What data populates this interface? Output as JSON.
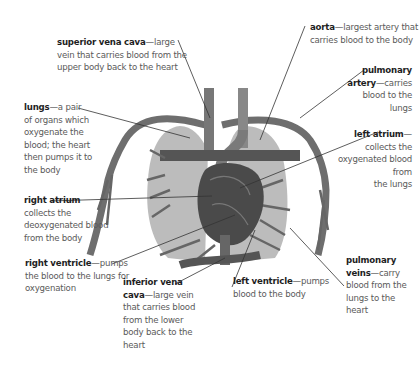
{
  "diagram": {
    "type": "heart-and-lungs-anatomy",
    "colors": {
      "lung": "#a9a9a9",
      "vessel": "#6e6e6e",
      "vessel_dark": "#3f3f3f",
      "heart": "#4a4a4a",
      "leader_line": "#333333",
      "text": "#5a5a5a",
      "term": "#1e1e1e"
    },
    "labels": [
      {
        "id": "superior-vena-cava",
        "term": "superior vena cava",
        "desc_lines": [
          "—large",
          "vein that carries blood from the",
          "upper body back to the heart"
        ]
      },
      {
        "id": "aorta",
        "term": "aorta",
        "desc_lines": [
          "—largest artery that",
          "carries blood to the body"
        ]
      },
      {
        "id": "pulmonary-artery",
        "term_lines": [
          "pulmonary",
          "artery"
        ],
        "desc_lines": [
          "—carries",
          "blood to the",
          "lungs"
        ]
      },
      {
        "id": "lungs",
        "term": "lungs",
        "desc_lines": [
          "—a pair",
          "of organs which",
          "oxygenate the",
          "blood; the heart",
          "then pumps it to",
          "the body"
        ]
      },
      {
        "id": "left-atrium",
        "term": "left atrium",
        "desc_lines": [
          "—",
          "collects the",
          "oxygenated blood",
          "from",
          "the lungs"
        ]
      },
      {
        "id": "right-atrium",
        "term": "right atrium",
        "desc_lines": [
          "collects the",
          "deoxygenated  blood",
          "from the body"
        ]
      },
      {
        "id": "right-ventricle",
        "term": "right ventricle",
        "desc_lines": [
          "—pumps",
          "the blood to the lungs for",
          "oxygenation"
        ]
      },
      {
        "id": "inferior-vena-cava",
        "term_lines": [
          "inferior vena",
          "cava"
        ],
        "desc_lines": [
          "—large vein",
          "that carries blood",
          "from the lower",
          "body back to the",
          "heart"
        ]
      },
      {
        "id": "left-ventricle",
        "term": "left ventricle",
        "desc_lines": [
          "—pumps",
          "blood to the body"
        ]
      },
      {
        "id": "pulmonary-veins",
        "term_lines": [
          "pulmonary",
          "veins"
        ],
        "desc_lines": [
          "—carry",
          "blood from the",
          "lungs to the heart"
        ]
      }
    ]
  }
}
